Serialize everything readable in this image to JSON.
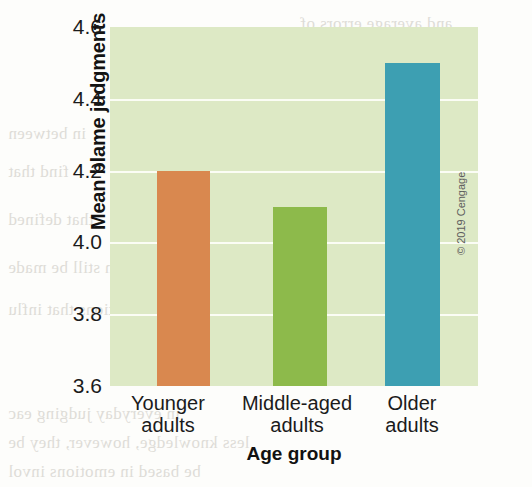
{
  "chart_data": {
    "type": "bar",
    "title": "",
    "xlabel": "Age group",
    "ylabel": "Mean blame judgments",
    "categories": [
      "Younger adults",
      "Middle-aged adults",
      "Older adults"
    ],
    "category_lines": [
      [
        "Younger",
        "adults"
      ],
      [
        "Middle-aged",
        "adults"
      ],
      [
        "Older",
        "adults"
      ]
    ],
    "values": [
      4.2,
      4.1,
      4.5
    ],
    "bar_colors": [
      "#d9884f",
      "#8dba4b",
      "#3d9fb2"
    ],
    "ylim": [
      3.6,
      4.6
    ],
    "yticks": [
      "4.6",
      "4.4",
      "4.2",
      "4.0",
      "3.8",
      "3.6"
    ],
    "ytick_values": [
      4.6,
      4.4,
      4.2,
      4.0,
      3.8,
      3.6
    ],
    "grid": true,
    "gridline_color": "#fbfdf5",
    "plot_background": "#dde9c5",
    "legend": null,
    "legend_position": "none"
  },
  "credit": {
    "text": "© 2019 Cengage"
  },
  "bleed_text": {
    "lines": [
      "and average errors of",
      "you reach a conclusion",
      "back toward the",
      "in between",
      "find that",
      "that defined",
      "can still be made",
      "situations that influ",
      "in everyday judging eac",
      "less knowledge, however, they be",
      "be based in emotions invol"
    ]
  }
}
